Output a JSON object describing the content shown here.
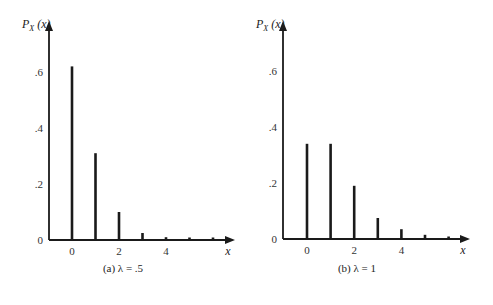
{
  "chart_data": [
    {
      "type": "bar",
      "title": "(a) λ = .5",
      "caption": "(a)  λ = .5",
      "ylabel": "P_X(x)",
      "xlabel": "x",
      "x": [
        0,
        1,
        2,
        3,
        4,
        5,
        6
      ],
      "values": [
        0.62,
        0.31,
        0.1,
        0.025,
        0.01,
        0.005,
        0.005
      ],
      "x_ticks": [
        "0",
        "2",
        "4"
      ],
      "y_ticks": [
        "0",
        ".2",
        ".4",
        ".6"
      ],
      "ylim": [
        0,
        0.7
      ]
    },
    {
      "type": "bar",
      "title": "(b) λ = 1",
      "caption": "(b)  λ = 1",
      "ylabel": "P_X(x)",
      "xlabel": "x",
      "x": [
        0,
        1,
        2,
        3,
        4,
        5,
        6
      ],
      "values": [
        0.34,
        0.34,
        0.19,
        0.075,
        0.035,
        0.015,
        0.007
      ],
      "x_ticks": [
        "0",
        "2",
        "4"
      ],
      "y_ticks": [
        "0",
        ".2",
        ".4",
        ".6"
      ],
      "ylim": [
        0,
        0.7
      ]
    }
  ],
  "colors": {
    "ink": "#1a1a1a",
    "background": "#ffffff"
  }
}
